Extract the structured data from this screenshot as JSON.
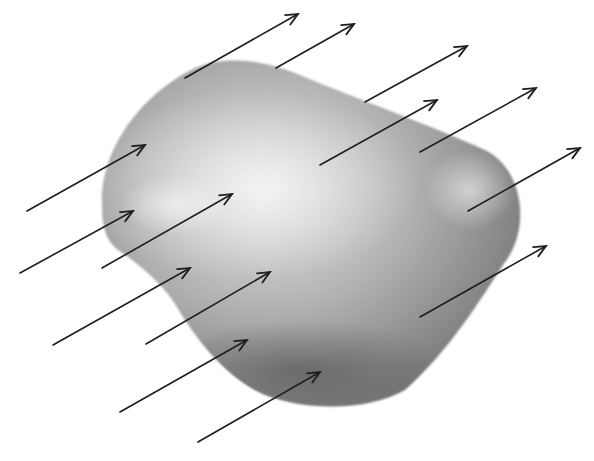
{
  "figure": {
    "colors": {
      "background": "#ffffff",
      "surface_light": "#e6e6e6",
      "surface_mid": "#b4b4b4",
      "surface_dark": "#6e6e6e",
      "arrow": "#1e1e1e"
    },
    "surface": {
      "name": "closed-surface",
      "shading": "spherical highlight upper-left"
    },
    "field_arrows": {
      "count": 14,
      "direction": "up-right",
      "style": "open-arrowhead"
    }
  }
}
